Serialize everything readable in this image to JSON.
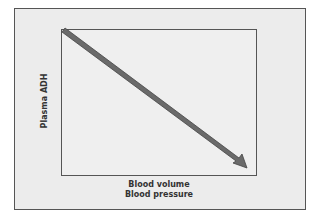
{
  "diagram": {
    "y_axis_label": "Plasma ADH",
    "x_axis_label_line1": "Blood volume",
    "x_axis_label_line2": "Blood pressure",
    "relationship": "inverse",
    "arrow_color": "#6a6a6a",
    "arrow_outline": "#444444"
  }
}
